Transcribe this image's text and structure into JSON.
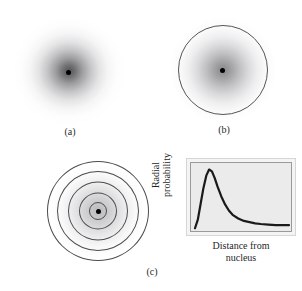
{
  "figure": {
    "panels": [
      {
        "id": "a",
        "caption": "(a)",
        "kind": "electron-density-cloud",
        "description": "Electron probability density cloud, densest at the nucleus and fading outward",
        "has_nucleus_dot": true,
        "has_boundary_circle": false
      },
      {
        "id": "b",
        "caption": "(b)",
        "kind": "boundary-surface",
        "description": "Electron density cloud enclosed by a spherical boundary surface",
        "has_nucleus_dot": true,
        "has_boundary_circle": true
      },
      {
        "id": "c",
        "caption": "(c)",
        "kind": "radial-shells",
        "description": "Concentric radial shells with the corresponding radial probability plot",
        "has_nucleus_dot": true,
        "shell_count": 5,
        "shell_radii_px": [
          9,
          19,
          30,
          41,
          51
        ]
      }
    ]
  },
  "colors": {
    "nucleus": "#000000",
    "boundary_stroke": "#55555a",
    "shell_stroke": "#4c4c50",
    "plot_background": "#ebebeb",
    "plot_frame": "#9a9a9a",
    "plot_outer_frame": "#d6d6d6",
    "curve": "#1a1a1a",
    "page_background": "#ffffff"
  },
  "chart_data": {
    "type": "line",
    "title": "",
    "xlabel_lines": [
      "Distance from",
      "nucleus"
    ],
    "ylabel_lines": [
      "Radial",
      "probability"
    ],
    "xlabel": "Distance from nucleus",
    "ylabel": "Radial probability",
    "grid": false,
    "legend": "none",
    "xlim": [
      0,
      1
    ],
    "ylim": [
      0,
      1
    ],
    "x_tick_labels": [],
    "y_tick_labels": [],
    "series": [
      {
        "name": "1s radial probability",
        "x": [
          0.0,
          0.03,
          0.06,
          0.09,
          0.12,
          0.15,
          0.18,
          0.21,
          0.24,
          0.28,
          0.32,
          0.36,
          0.4,
          0.46,
          0.52,
          0.58,
          0.64,
          0.7,
          0.78,
          0.86,
          0.94,
          1.0
        ],
        "y": [
          0.0,
          0.14,
          0.4,
          0.66,
          0.86,
          0.96,
          0.93,
          0.82,
          0.68,
          0.52,
          0.39,
          0.29,
          0.22,
          0.16,
          0.12,
          0.1,
          0.08,
          0.07,
          0.06,
          0.05,
          0.05,
          0.05
        ]
      }
    ],
    "peak": {
      "x": 0.16,
      "y": 0.97,
      "note": "most probable radius"
    }
  }
}
